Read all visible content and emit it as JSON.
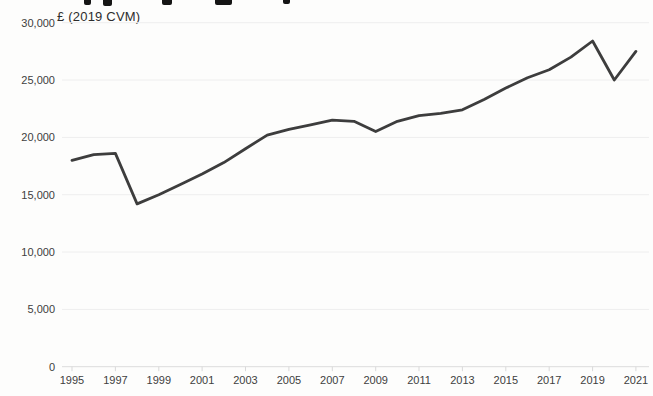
{
  "header": {
    "unit_label": "£ (2019 CVM)"
  },
  "chart_data": {
    "type": "line",
    "title_visible": false,
    "subtitle": "£ (2019 CVM)",
    "x": [
      1995,
      1996,
      1997,
      1998,
      1999,
      2000,
      2001,
      2002,
      2003,
      2004,
      2005,
      2006,
      2007,
      2008,
      2009,
      2010,
      2011,
      2012,
      2013,
      2014,
      2015,
      2016,
      2017,
      2018,
      2019,
      2020,
      2021
    ],
    "values": [
      18000,
      18500,
      18600,
      14200,
      15000,
      15900,
      16800,
      17800,
      19000,
      20200,
      20700,
      21100,
      21500,
      21400,
      20500,
      21400,
      21900,
      22100,
      22400,
      23300,
      24300,
      25200,
      25900,
      27000,
      28400,
      25000,
      27500
    ],
    "series_name": "£ per head (2019 CVM)",
    "x_tick_years": [
      1995,
      1997,
      1999,
      2001,
      2003,
      2005,
      2007,
      2009,
      2011,
      2013,
      2015,
      2017,
      2019,
      2021
    ],
    "x_tick_labels": [
      "1995",
      "1997",
      "1999",
      "2001",
      "2003",
      "2005",
      "2007",
      "2009",
      "2011",
      "2013",
      "2015",
      "2017",
      "2019",
      "2021"
    ],
    "y_ticks": [
      0,
      5000,
      10000,
      15000,
      20000,
      25000,
      30000
    ],
    "y_tick_labels": [
      "0",
      "5,000",
      "10,000",
      "15,000",
      "20,000",
      "25,000",
      "30,000"
    ],
    "ylim": [
      0,
      30000
    ],
    "xlim": [
      1995,
      2021
    ],
    "grid": "faint horizontal gridlines at 5,000 intervals",
    "legend": "none",
    "colors": {
      "line": "#3d3d3d",
      "grid": "#eeeeee",
      "axis": "#dcdcdc",
      "tick": "#d9d9d9",
      "tick_label": "#404040"
    }
  }
}
